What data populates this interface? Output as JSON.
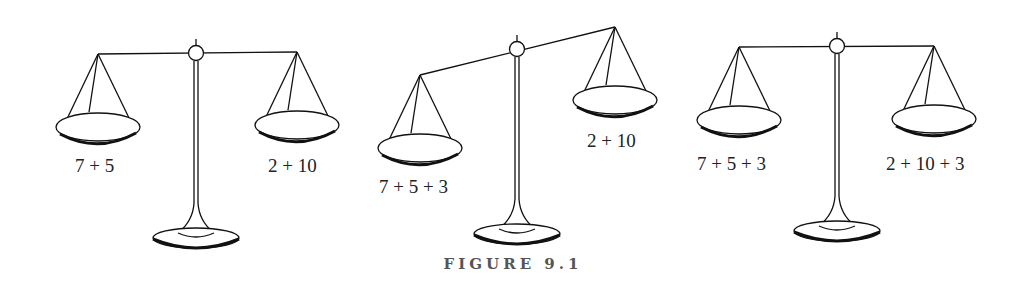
{
  "figure": {
    "caption": "FIGURE 9.1",
    "scales": [
      {
        "state": "balanced",
        "left_label": "7 + 5",
        "right_label": "2 + 10"
      },
      {
        "state": "tipped-left",
        "left_label": "7 + 5 + 3",
        "right_label": "2 + 10"
      },
      {
        "state": "balanced",
        "left_label": "7 + 5 + 3",
        "right_label": "2 + 10 + 3"
      }
    ]
  }
}
